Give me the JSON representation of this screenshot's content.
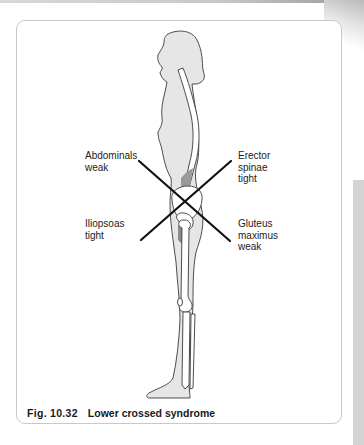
{
  "figure": {
    "caption_number": "Fig. 10.32",
    "caption_title": "Lower crossed syndrome",
    "labels": {
      "top_left": "Abdominals\nweak",
      "top_right": "Erector\nspinae\ntight",
      "bottom_left": "Iliopsoas\ntight",
      "bottom_right": "Gluteus\nmaximus\nweak"
    },
    "colors": {
      "body_fill": "#e6e6e6",
      "outline": "#3a3a3a",
      "bone_fill": "#ffffff",
      "muscle_shade": "#9a9a9a",
      "cross_lines": "#111111"
    }
  }
}
